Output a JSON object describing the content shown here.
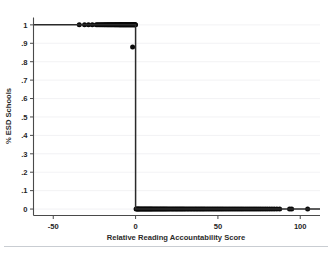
{
  "figure": {
    "background_color": "#ffffff",
    "point_color": "#0a0a0a",
    "line_color": "#2a2a2a",
    "grid_color": "#f0f1f3",
    "axis_color": "#4a4a4a"
  },
  "chart_data": {
    "type": "scatter",
    "title": "",
    "xlabel": "Relative Reading Accountability Score",
    "ylabel": "% ESD Schools",
    "xlim": [
      -62,
      112
    ],
    "ylim": [
      -0.035,
      1.04
    ],
    "xticks": [
      -50,
      0,
      50,
      100
    ],
    "xtick_labels": [
      "-50",
      "0",
      "50",
      "100"
    ],
    "yticks": [
      0,
      0.1,
      0.2,
      0.3,
      0.4,
      0.5,
      0.6,
      0.7,
      0.8,
      0.9,
      1
    ],
    "ytick_labels": [
      "0",
      ".1",
      ".2",
      ".3",
      ".4",
      ".5",
      ".6",
      ".7",
      ".8",
      ".9",
      "1"
    ],
    "grid": "horizontal",
    "legend": "none",
    "cutoff_x": 0,
    "series": [
      {
        "name": "ESD schools treated (left of cutoff)",
        "marker": "filled-circle",
        "points": [
          [
            -34.2,
            1
          ],
          [
            -31.0,
            1
          ],
          [
            -28.6,
            1
          ],
          [
            -26.3,
            1
          ],
          [
            -23.9,
            1
          ],
          [
            -23.0,
            1
          ],
          [
            -22.2,
            1
          ],
          [
            -21.4,
            1
          ],
          [
            -20.6,
            1
          ],
          [
            -19.9,
            1
          ],
          [
            -19.2,
            1
          ],
          [
            -18.6,
            1
          ],
          [
            -18.0,
            1
          ],
          [
            -17.4,
            1
          ],
          [
            -16.9,
            1
          ],
          [
            -16.4,
            1
          ],
          [
            -15.9,
            1
          ],
          [
            -15.4,
            1
          ],
          [
            -14.9,
            1
          ],
          [
            -14.4,
            1
          ],
          [
            -13.9,
            1
          ],
          [
            -13.4,
            1
          ],
          [
            -12.9,
            1
          ],
          [
            -12.5,
            1
          ],
          [
            -12.1,
            1
          ],
          [
            -11.7,
            1
          ],
          [
            -11.3,
            1
          ],
          [
            -10.9,
            1
          ],
          [
            -10.5,
            1
          ],
          [
            -10.1,
            1
          ],
          [
            -9.8,
            1
          ],
          [
            -9.5,
            1
          ],
          [
            -9.2,
            1
          ],
          [
            -8.9,
            1
          ],
          [
            -8.6,
            1
          ],
          [
            -8.3,
            1
          ],
          [
            -8.0,
            1
          ],
          [
            -7.7,
            1
          ],
          [
            -7.4,
            1
          ],
          [
            -7.1,
            1
          ],
          [
            -6.8,
            1
          ],
          [
            -6.5,
            1
          ],
          [
            -6.2,
            1
          ],
          [
            -5.9,
            1
          ],
          [
            -5.6,
            1
          ],
          [
            -5.3,
            1
          ],
          [
            -5.0,
            1
          ],
          [
            -4.7,
            1
          ],
          [
            -4.4,
            1
          ],
          [
            -4.1,
            1
          ],
          [
            -3.8,
            1
          ],
          [
            -3.5,
            1
          ],
          [
            -3.2,
            1
          ],
          [
            -2.9,
            1
          ],
          [
            -2.6,
            1
          ],
          [
            -2.3,
            1
          ],
          [
            -2.0,
            1
          ],
          [
            -1.7,
            1
          ],
          [
            -1.4,
            1
          ],
          [
            -1.1,
            1
          ],
          [
            -0.8,
            1
          ],
          [
            -0.5,
            1
          ],
          [
            -0.25,
            1
          ],
          [
            -0.05,
            1
          ],
          [
            -1.8,
            0.88
          ]
        ]
      },
      {
        "name": "ESD schools untreated (right of cutoff)",
        "marker": "filled-circle",
        "points": [
          [
            0.3,
            0
          ],
          [
            0.8,
            0
          ],
          [
            1.3,
            0
          ],
          [
            1.8,
            0
          ],
          [
            2.3,
            0
          ],
          [
            2.9,
            0
          ],
          [
            3.5,
            0
          ],
          [
            4.1,
            0
          ],
          [
            4.7,
            0
          ],
          [
            5.3,
            0
          ],
          [
            5.9,
            0
          ],
          [
            6.5,
            0
          ],
          [
            7.1,
            0
          ],
          [
            7.7,
            0
          ],
          [
            8.3,
            0
          ],
          [
            8.9,
            0
          ],
          [
            9.5,
            0
          ],
          [
            10.1,
            0
          ],
          [
            10.8,
            0
          ],
          [
            11.5,
            0
          ],
          [
            12.2,
            0
          ],
          [
            12.9,
            0
          ],
          [
            13.6,
            0
          ],
          [
            14.3,
            0
          ],
          [
            15.0,
            0
          ],
          [
            15.7,
            0
          ],
          [
            16.4,
            0
          ],
          [
            17.1,
            0
          ],
          [
            17.8,
            0
          ],
          [
            18.5,
            0
          ],
          [
            19.2,
            0
          ],
          [
            20.0,
            0
          ],
          [
            20.8,
            0
          ],
          [
            21.6,
            0
          ],
          [
            22.4,
            0
          ],
          [
            23.2,
            0
          ],
          [
            24.0,
            0
          ],
          [
            24.8,
            0
          ],
          [
            25.6,
            0
          ],
          [
            26.4,
            0
          ],
          [
            27.2,
            0
          ],
          [
            28.0,
            0
          ],
          [
            28.8,
            0
          ],
          [
            29.6,
            0
          ],
          [
            30.5,
            0
          ],
          [
            31.4,
            0
          ],
          [
            32.3,
            0
          ],
          [
            33.2,
            0
          ],
          [
            34.1,
            0
          ],
          [
            35.0,
            0
          ],
          [
            35.9,
            0
          ],
          [
            36.8,
            0
          ],
          [
            37.7,
            0
          ],
          [
            38.6,
            0
          ],
          [
            39.5,
            0
          ],
          [
            40.4,
            0
          ],
          [
            41.3,
            0
          ],
          [
            42.2,
            0
          ],
          [
            43.2,
            0
          ],
          [
            44.2,
            0
          ],
          [
            45.2,
            0
          ],
          [
            46.2,
            0
          ],
          [
            47.2,
            0
          ],
          [
            48.2,
            0
          ],
          [
            49.2,
            0
          ],
          [
            50.2,
            0
          ],
          [
            51.2,
            0
          ],
          [
            52.2,
            0
          ],
          [
            53.2,
            0
          ],
          [
            54.3,
            0
          ],
          [
            55.4,
            0
          ],
          [
            56.5,
            0
          ],
          [
            57.6,
            0
          ],
          [
            58.7,
            0
          ],
          [
            59.8,
            0
          ],
          [
            60.9,
            0
          ],
          [
            62.0,
            0
          ],
          [
            63.1,
            0
          ],
          [
            64.2,
            0
          ],
          [
            65.3,
            0
          ],
          [
            66.5,
            0
          ],
          [
            67.7,
            0
          ],
          [
            68.9,
            0
          ],
          [
            70.1,
            0
          ],
          [
            71.3,
            0
          ],
          [
            72.5,
            0
          ],
          [
            73.7,
            0
          ],
          [
            74.9,
            0
          ],
          [
            76.1,
            0
          ],
          [
            77.4,
            0
          ],
          [
            78.7,
            0
          ],
          [
            80.0,
            0
          ],
          [
            81.4,
            0
          ],
          [
            82.8,
            0
          ],
          [
            84.2,
            0
          ],
          [
            85.8,
            0
          ],
          [
            87.5,
            0
          ],
          [
            93.5,
            0
          ],
          [
            94.8,
            0
          ],
          [
            104.5,
            0
          ]
        ]
      }
    ],
    "step_line": {
      "name": "discontinuity-at-cutoff",
      "points": [
        [
          -62,
          1
        ],
        [
          0,
          1
        ],
        [
          0,
          0
        ],
        [
          112,
          0
        ]
      ]
    }
  }
}
